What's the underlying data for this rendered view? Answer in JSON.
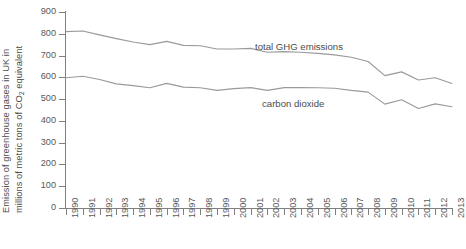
{
  "chart_data": {
    "type": "line",
    "title": "",
    "xlabel": "",
    "ylabel": "Emission of greenhouse gases in UK in millions of metric tons of CO2 equivalent",
    "ylabel_line1": "Emission of greenhouse gases in UK in",
    "ylabel_line2_pre": "millions of metric tons of CO",
    "ylabel_line2_sub": "2",
    "ylabel_line2_post": " equivalent",
    "ylim": [
      0,
      900
    ],
    "ytick_step": 100,
    "yticks": [
      900,
      800,
      700,
      600,
      500,
      400,
      300,
      200,
      100,
      0
    ],
    "categories": [
      "1990",
      "1991",
      "1992",
      "1993",
      "1994",
      "1995",
      "1996",
      "1997",
      "1998",
      "1999",
      "2000",
      "2001",
      "2002",
      "2003",
      "2004",
      "2005",
      "2006",
      "2007",
      "2008",
      "2009",
      "2010",
      "2011",
      "2012",
      "2013"
    ],
    "x": [
      1990,
      1991,
      1992,
      1993,
      1994,
      1995,
      1996,
      1997,
      1998,
      1999,
      2000,
      2001,
      2002,
      2003,
      2004,
      2005,
      2006,
      2007,
      2008,
      2009,
      2010,
      2011,
      2012,
      2013
    ],
    "series": [
      {
        "name": "total GHG emissions",
        "label": "total GHG emissions",
        "color": "#9a9a9a",
        "values": [
          810,
          813,
          795,
          778,
          762,
          750,
          765,
          747,
          745,
          730,
          730,
          733,
          715,
          718,
          715,
          710,
          703,
          692,
          673,
          608,
          625,
          588,
          598,
          572
        ]
      },
      {
        "name": "carbon dioxide",
        "label": "carbon dioxide",
        "color": "#9a9a9a",
        "values": [
          598,
          605,
          590,
          570,
          562,
          552,
          572,
          555,
          552,
          540,
          548,
          553,
          540,
          553,
          553,
          552,
          550,
          540,
          532,
          477,
          497,
          457,
          478,
          465
        ]
      }
    ],
    "grid": false,
    "legend_position": "inline-annotations",
    "annotations": [
      {
        "text": "total GHG emissions",
        "x_px": 255,
        "y_px": 41
      },
      {
        "text": "carbon dioxide",
        "x_px": 262,
        "y_px": 98
      }
    ],
    "colors": {
      "line": "#9a9a9a",
      "axis": "#808080",
      "text": "#595959",
      "title_text": "#4d4d4d",
      "background": "#ffffff"
    }
  }
}
